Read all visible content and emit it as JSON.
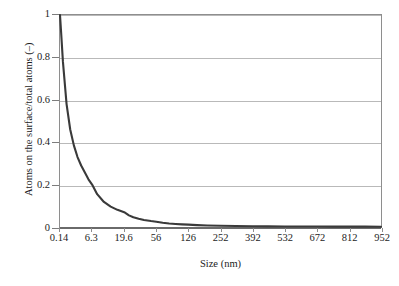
{
  "chart_data": {
    "type": "line",
    "title": "",
    "xlabel": "Size (nm)",
    "ylabel": "Atoms on the surface/total atoms (–)",
    "ylim": [
      0,
      1
    ],
    "yticks": [
      "0",
      "0.2",
      "0.4",
      "0.6",
      "0.8",
      "1"
    ],
    "ytick_values": [
      0,
      0.2,
      0.4,
      0.6,
      0.8,
      1
    ],
    "grid": "horizontal",
    "legend": "none",
    "x_axis_type": "category",
    "categories": [
      "0.14",
      "6.3",
      "19.6",
      "56",
      "126",
      "252",
      "392",
      "532",
      "672",
      "812",
      "952"
    ],
    "category_values": [
      0.14,
      6.3,
      19.6,
      56,
      126,
      252,
      392,
      532,
      672,
      812,
      952
    ],
    "series": [
      {
        "name": "Atoms on the surface/total atoms",
        "color": "#3a3a3a",
        "x": [
          0.14,
          0.35,
          0.7,
          1.4,
          2.1,
          2.8,
          3.5,
          4.2,
          5.6,
          6.3,
          8.4,
          11.2,
          14,
          16.8,
          19.6,
          25,
          30,
          36,
          42,
          50,
          56,
          70,
          84,
          98,
          112,
          126,
          160,
          200,
          252,
          320,
          392,
          460,
          532,
          600,
          672,
          742,
          812,
          882,
          952
        ],
        "values": [
          1.0,
          0.92,
          0.78,
          0.58,
          0.46,
          0.385,
          0.33,
          0.29,
          0.225,
          0.2,
          0.155,
          0.118,
          0.096,
          0.081,
          0.07,
          0.055,
          0.046,
          0.039,
          0.033,
          0.028,
          0.025,
          0.02,
          0.0167,
          0.0143,
          0.0125,
          0.0111,
          0.0088,
          0.007,
          0.0056,
          0.0044,
          0.0036,
          0.003,
          0.0026,
          0.0023,
          0.0021,
          0.0019,
          0.0017,
          0.0016,
          0.0015
        ]
      }
    ],
    "colors": {
      "series_line": "#3a3a3a",
      "gridline": "#b9b9b9",
      "axis": "#8e8e8e",
      "baseline": "#6a6a6a",
      "text": "#1c1c1c",
      "background": "#ffffff"
    }
  }
}
